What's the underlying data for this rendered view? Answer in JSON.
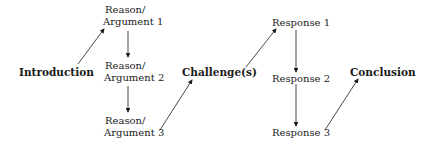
{
  "diagram": {
    "nodes": {
      "introduction": "Introduction",
      "reason1_line1": "Reason/",
      "reason1_line2": "Argument 1",
      "reason2_line1": "Reason/",
      "reason2_line2": "Argument 2",
      "reason3_line1": "Reason/",
      "reason3_line2": "Argument 3",
      "challenges": "Challenge(s)",
      "response1": "Response 1",
      "response2": "Response 2",
      "response3": "Response 3",
      "conclusion": "Conclusion"
    },
    "edges": [
      {
        "from": "Introduction",
        "to": "Reason/Argument 1"
      },
      {
        "from": "Reason/Argument 1",
        "to": "Reason/Argument 2"
      },
      {
        "from": "Reason/Argument 2",
        "to": "Reason/Argument 3"
      },
      {
        "from": "Reason/Argument 3",
        "to": "Challenge(s)"
      },
      {
        "from": "Challenge(s)",
        "to": "Response 1"
      },
      {
        "from": "Response 1",
        "to": "Response 2"
      },
      {
        "from": "Response 2",
        "to": "Response 3"
      },
      {
        "from": "Response 3",
        "to": "Conclusion"
      }
    ]
  }
}
